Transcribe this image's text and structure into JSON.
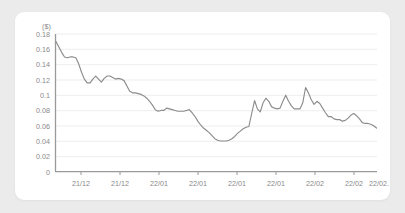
{
  "card": {
    "background_color": "#ffffff",
    "page_background_color": "#ebebeb"
  },
  "chart_data": {
    "type": "line",
    "title": "",
    "subtitle": "",
    "xlabel": "",
    "ylabel": "($)",
    "unit_label": "($)",
    "grid": true,
    "legend": null,
    "legend_position": "none",
    "line_color": "#8c8c8c",
    "axis_color": "#9a9a9a",
    "grid_color": "#e8e8e8",
    "tick_label_color": "#8a8a8a",
    "ylim": [
      0,
      0.18
    ],
    "yticks": [
      0,
      0.02,
      0.04,
      0.06,
      0.08,
      0.1,
      0.12,
      0.14,
      0.16,
      0.18
    ],
    "ytick_labels": [
      "0",
      "0.02",
      "0.04",
      "0.06",
      "0.08",
      "0.1",
      "0.12",
      "0.14",
      "0.16",
      "0.18"
    ],
    "xtick_labels": [
      "21/12",
      "21/12",
      "22/01",
      "22/01",
      "22/01",
      "22/01",
      "22/02",
      "22/02",
      "22/02."
    ],
    "xtick_positions": [
      0.082,
      0.203,
      0.324,
      0.444,
      0.565,
      0.686,
      0.806,
      0.916,
      0.985
    ],
    "xlim": [
      0,
      96
    ],
    "x": [
      0,
      1,
      2,
      3,
      4,
      5,
      6,
      7,
      8,
      9,
      10,
      11,
      12,
      13,
      14,
      15,
      16,
      17,
      18,
      19,
      20,
      21,
      22,
      23,
      24,
      25,
      26,
      27,
      28,
      29,
      30,
      31,
      32,
      33,
      34,
      35,
      36,
      37,
      38,
      39,
      40,
      41,
      42,
      43,
      44,
      45,
      46,
      47,
      48,
      49,
      50,
      51,
      52,
      53,
      54,
      55,
      56,
      57,
      58,
      59,
      60,
      61,
      62,
      63,
      64,
      65,
      66,
      67,
      68,
      69,
      70,
      71,
      72,
      73,
      74,
      75,
      76,
      77,
      78,
      79,
      80,
      81,
      82,
      83,
      84,
      85,
      86,
      87,
      88,
      89,
      90,
      91,
      92,
      93,
      94,
      95,
      96
    ],
    "values": [
      0.17,
      0.163,
      0.156,
      0.15,
      0.149,
      0.15,
      0.15,
      0.149,
      0.141,
      0.13,
      0.121,
      0.116,
      0.116,
      0.121,
      0.125,
      0.121,
      0.117,
      0.122,
      0.125,
      0.125,
      0.123,
      0.121,
      0.122,
      0.121,
      0.119,
      0.112,
      0.105,
      0.103,
      0.103,
      0.102,
      0.101,
      0.099,
      0.096,
      0.092,
      0.087,
      0.081,
      0.079,
      0.08,
      0.08,
      0.083,
      0.082,
      0.081,
      0.08,
      0.079,
      0.079,
      0.079,
      0.08,
      0.081,
      0.077,
      0.072,
      0.066,
      0.061,
      0.057,
      0.054,
      0.051,
      0.047,
      0.043,
      0.041,
      0.04,
      0.04,
      0.04,
      0.041,
      0.043,
      0.046,
      0.05,
      0.053,
      0.056,
      0.058,
      0.059,
      0.076,
      0.093,
      0.082,
      0.078,
      0.09,
      0.096,
      0.092,
      0.085,
      0.083,
      0.082,
      0.083,
      0.092,
      0.1,
      0.092,
      0.086,
      0.082,
      0.082,
      0.082,
      0.09,
      0.11,
      0.103,
      0.094,
      0.088,
      0.092,
      0.089,
      0.083,
      0.077,
      0.072
    ]
  },
  "chart_tail": {
    "values": [
      0.072,
      0.069,
      0.068,
      0.068,
      0.066,
      0.067,
      0.07,
      0.074,
      0.076,
      0.073,
      0.069,
      0.064,
      0.063,
      0.063,
      0.062,
      0.06,
      0.057
    ]
  }
}
